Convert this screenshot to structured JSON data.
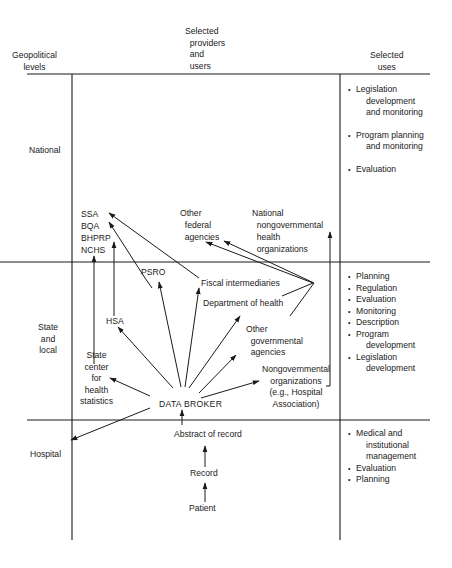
{
  "headers": {
    "levels": "Geopolitical\nlevels",
    "providers": "Selected\n  providers\n  and\n  users",
    "uses": "Selected\nuses"
  },
  "levels": {
    "national": "National",
    "state": "State\nand\nlocal",
    "hospital": "Hospital"
  },
  "nodes": {
    "ssa": "SSA",
    "bqa": "BQA",
    "bhprp": "BHPRP",
    "nchs": "NCHS",
    "other_federal": "Other\n  federal\n  agencies",
    "national_ngo": "National\n  nongovernmental\n  health\n  organizations",
    "psro": "PSRO",
    "fiscal": "Fiscal intermediaries",
    "dept_health": "Department of health",
    "hsa": "HSA",
    "other_gov": "Other\n  governmental\n  agencies",
    "state_center": "State\ncenter\nfor\nhealth\nstatistics",
    "ngo": "Nongovernmental\norganizations\n(e.g., Hospital\nAssociation)",
    "data_broker": "DATA BROKER",
    "abstract": "Abstract of record",
    "record": "Record",
    "patient": "Patient"
  },
  "uses": {
    "national": [
      {
        "first": "Legislation",
        "rest": "development\nand monitoring"
      },
      {
        "first": "Program planning",
        "rest": "and monitoring"
      },
      {
        "first": "Evaluation",
        "rest": ""
      }
    ],
    "state": [
      {
        "first": "Planning",
        "rest": ""
      },
      {
        "first": "Regulation",
        "rest": ""
      },
      {
        "first": "Evaluation",
        "rest": ""
      },
      {
        "first": "Monitoring",
        "rest": ""
      },
      {
        "first": "Description",
        "rest": ""
      },
      {
        "first": "Program",
        "rest": "development"
      },
      {
        "first": "Legislation",
        "rest": "development"
      }
    ],
    "hospital": [
      {
        "first": "Medical and",
        "rest": "institutional\nmanagement"
      },
      {
        "first": "Evaluation",
        "rest": ""
      },
      {
        "first": "Planning",
        "rest": ""
      }
    ]
  },
  "colors": {
    "ink": "#1a1a1a",
    "background": "#ffffff"
  }
}
